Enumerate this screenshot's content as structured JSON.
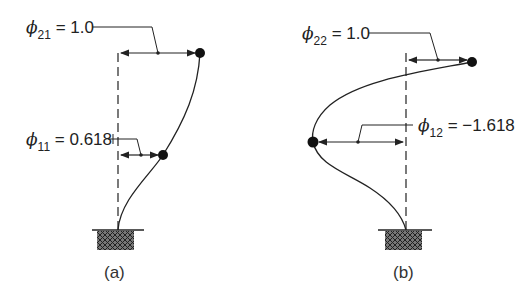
{
  "figure": {
    "panels": [
      {
        "id": "a",
        "caption": "(a)",
        "mode_shape": "first mode",
        "labels": [
          {
            "symbol": "ϕ",
            "subscript": "21",
            "text": "= 1.0"
          },
          {
            "symbol": "ϕ",
            "subscript": "11",
            "text": "= 0.618"
          }
        ]
      },
      {
        "id": "b",
        "caption": "(b)",
        "mode_shape": "second mode",
        "labels": [
          {
            "symbol": "ϕ",
            "subscript": "22",
            "text": "= 1.0"
          },
          {
            "symbol": "ϕ",
            "subscript": "12",
            "text": "= −1.618"
          }
        ]
      }
    ],
    "colors": {
      "line": "#222222",
      "background": "#ffffff"
    }
  }
}
